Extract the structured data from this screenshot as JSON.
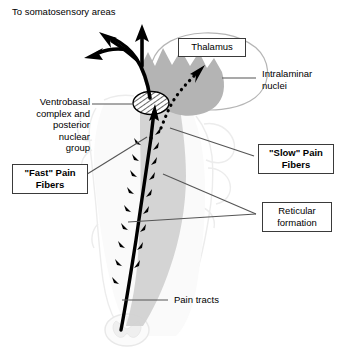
{
  "figure": {
    "background_color": "#ffffff",
    "colors": {
      "ink": "#000000",
      "leader_line": "#555555",
      "box_border": "#3a3a3a",
      "thalamus_gray": "#b4b4b4",
      "reticular_gray": "#d2d2d2",
      "faint_outline": "#ececec",
      "hatch": "#1a1a1a"
    }
  },
  "labels": {
    "to_somatosensory": {
      "text": "To somatosensory areas",
      "style": "plain",
      "align": "left"
    },
    "thalamus": {
      "text": "Thalamus",
      "style": "boxed",
      "align": "center"
    },
    "intralaminar_nuclei": {
      "text": "Intralaminar\nnuclei",
      "style": "plain",
      "align": "left"
    },
    "ventrobasal": {
      "text": "Ventrobasal\ncomplex and\nposterior\nnuclear\ngroup",
      "style": "plain",
      "align": "right"
    },
    "fast_pain_fibers": {
      "text": "\"Fast\" Pain\nFibers",
      "style": "boxed-bold",
      "align": "center"
    },
    "slow_pain_fibers": {
      "text": "\"Slow\" Pain\nFibers",
      "style": "boxed-bold",
      "align": "center"
    },
    "reticular_formation": {
      "text": "Reticular\nformation",
      "style": "boxed",
      "align": "center"
    },
    "pain_tracts": {
      "text": "Pain tracts",
      "style": "plain",
      "align": "left"
    }
  },
  "structures": {
    "thalamus_outline": "thalamus-ellipse-outline",
    "thalamus_nuclei": "jagged-gray-nuclei-region",
    "ventrobasal_ellipse": "hatched-ellipse",
    "reticular_band": "gray-ascending-band",
    "brainstem_outline": "faint-brainstem-silhouette",
    "spinal_cord_section": "faint-butterfly-cross-section",
    "fast_tract": "thick-black-ascending-tract",
    "slow_tract": "dotted-ascending-tract",
    "collateral_barbs": "branching-arrow-barbs",
    "cortical_arrows": "three-arrows-to-cortex"
  }
}
